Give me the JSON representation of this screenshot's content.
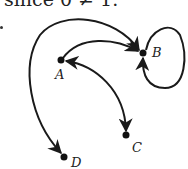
{
  "caption": {
    "text": "since 0 ≠ 1."
  },
  "graph": {
    "type": "directed-graph",
    "nodes": [
      {
        "id": "A",
        "label": "A",
        "x": 61,
        "y": 60
      },
      {
        "id": "B",
        "label": "B",
        "x": 143,
        "y": 53
      },
      {
        "id": "C",
        "label": "C",
        "x": 126,
        "y": 135
      },
      {
        "id": "D",
        "label": "D",
        "x": 64,
        "y": 157
      }
    ],
    "edges": [
      {
        "from": "A",
        "to": "B"
      },
      {
        "from": "A",
        "to": "C",
        "bidirectional": true
      },
      {
        "from": "B",
        "to": "D",
        "bidirectional": true
      },
      {
        "from": "B",
        "to": "B",
        "self_loop": true
      }
    ],
    "colors": {
      "stroke": "#1a1a1a",
      "node": "#111111"
    }
  }
}
